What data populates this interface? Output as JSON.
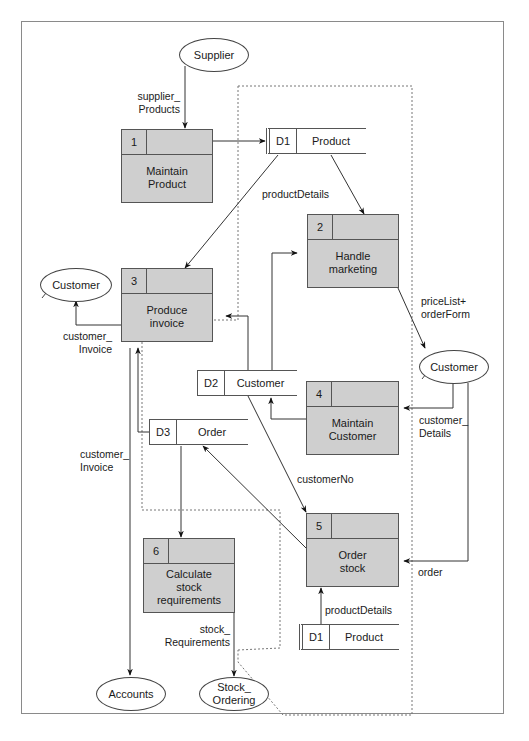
{
  "diagram": {
    "type": "data-flow-diagram",
    "processes": [
      {
        "id": "1",
        "name": "Maintain\nProduct"
      },
      {
        "id": "2",
        "name": "Handle\nmarketing"
      },
      {
        "id": "3",
        "name": "Produce\ninvoice"
      },
      {
        "id": "4",
        "name": "Maintain\nCustomer"
      },
      {
        "id": "5",
        "name": "Order\nstock"
      },
      {
        "id": "6",
        "name": "Calculate\nstock\nrequirements"
      }
    ],
    "data_stores": [
      {
        "id": "D1",
        "name": "Product"
      },
      {
        "id": "D2",
        "name": "Customer"
      },
      {
        "id": "D3",
        "name": "Order"
      },
      {
        "id": "D1",
        "name": "Product"
      }
    ],
    "external_entities": [
      {
        "name": "Supplier"
      },
      {
        "name": "Customer"
      },
      {
        "name": "Customer"
      },
      {
        "name": "Accounts"
      },
      {
        "name": "Stock_\nOrdering"
      }
    ],
    "flows": [
      {
        "label": "supplier_\nProducts",
        "from": "Supplier",
        "to": "1"
      },
      {
        "label": "",
        "from": "1",
        "to": "D1"
      },
      {
        "label": "productDetails",
        "from": "D1",
        "to": "3"
      },
      {
        "label": "",
        "from": "D1",
        "to": "2"
      },
      {
        "label": "priceList+\norderForm",
        "from": "2",
        "to": "Customer"
      },
      {
        "label": "customer_\nInvoice",
        "from": "3",
        "to": "Customer"
      },
      {
        "label": "customer_\nDetails",
        "from": "Customer",
        "to": "4"
      },
      {
        "label": "",
        "from": "4",
        "to": "D2"
      },
      {
        "label": "",
        "from": "D2",
        "to": "2"
      },
      {
        "label": "",
        "from": "D2",
        "to": "3"
      },
      {
        "label": "customerNo",
        "from": "D2",
        "to": "5"
      },
      {
        "label": "",
        "from": "5",
        "to": "D3"
      },
      {
        "label": "",
        "from": "D3",
        "to": "3"
      },
      {
        "label": "",
        "from": "D3",
        "to": "6"
      },
      {
        "label": "order",
        "from": "Customer",
        "to": "5"
      },
      {
        "label": "productDetails",
        "from": "D1",
        "to": "5"
      },
      {
        "label": "customer_\nInvoice",
        "from": "3",
        "to": "Accounts"
      },
      {
        "label": "stock_\nRequirements",
        "from": "6",
        "to": "Stock_Ordering"
      }
    ]
  }
}
